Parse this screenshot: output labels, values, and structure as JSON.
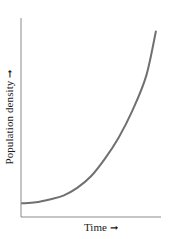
{
  "chart_data": {
    "type": "line",
    "title": "",
    "xlabel": "Time",
    "ylabel": "Population density",
    "x_tick_labels": [],
    "y_tick_labels": [],
    "grid": false,
    "legend": null,
    "xlim": [
      0,
      1
    ],
    "ylim": [
      0,
      1
    ],
    "series": [
      {
        "name": "Exponential growth",
        "color": "#707070",
        "x": [
          0.0,
          0.1,
          0.2,
          0.3,
          0.4,
          0.5,
          0.6,
          0.7,
          0.8,
          0.9,
          0.97
        ],
        "y": [
          0.04,
          0.045,
          0.06,
          0.08,
          0.12,
          0.18,
          0.27,
          0.38,
          0.52,
          0.7,
          0.93
        ]
      }
    ],
    "annotations": [
      "axis arrows indicate increasing direction"
    ]
  },
  "labels": {
    "y_axis": "Population density",
    "x_axis": "Time",
    "arrow": "➞"
  },
  "style": {
    "axis_color": "#8a8a8a",
    "curve_color": "#707070"
  }
}
